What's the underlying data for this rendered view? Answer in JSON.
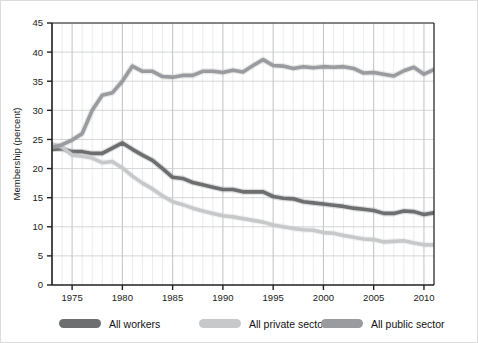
{
  "chart_data": {
    "type": "line",
    "title": "",
    "xlabel": "",
    "ylabel": "Membership (percent)",
    "xlim": [
      1973,
      2011
    ],
    "ylim": [
      0,
      45
    ],
    "ytick_step": 5,
    "grid": "vertical-yearly-and-horizontal-major",
    "legend_position": "bottom",
    "x": [
      1973,
      1974,
      1975,
      1976,
      1977,
      1978,
      1979,
      1980,
      1981,
      1982,
      1983,
      1984,
      1985,
      1986,
      1987,
      1988,
      1989,
      1990,
      1991,
      1992,
      1993,
      1994,
      1995,
      1996,
      1997,
      1998,
      1999,
      2000,
      2001,
      2002,
      2003,
      2004,
      2005,
      2006,
      2007,
      2008,
      2009,
      2010,
      2011
    ],
    "xticks": [
      1975,
      1980,
      1985,
      1990,
      1995,
      2000,
      2005,
      2010
    ],
    "yticks": [
      0,
      5,
      10,
      15,
      20,
      25,
      30,
      35,
      40,
      45
    ],
    "series": [
      {
        "name": "All workers",
        "color": "#6d6e70",
        "values": [
          23.3,
          23.4,
          22.9,
          22.9,
          22.6,
          22.6,
          23.5,
          24.4,
          23.3,
          22.3,
          21.4,
          20.0,
          18.5,
          18.3,
          17.6,
          17.2,
          16.8,
          16.4,
          16.4,
          16.0,
          16.0,
          16.0,
          15.2,
          14.9,
          14.8,
          14.3,
          14.1,
          13.9,
          13.7,
          13.5,
          13.2,
          13.0,
          12.8,
          12.3,
          12.3,
          12.7,
          12.6,
          12.1,
          12.4
        ]
      },
      {
        "name": "All private sector",
        "color": "#c6c8ca",
        "values": [
          24.2,
          23.7,
          22.3,
          22.1,
          21.8,
          21.0,
          21.2,
          20.1,
          18.7,
          17.5,
          16.5,
          15.3,
          14.3,
          13.8,
          13.2,
          12.7,
          12.3,
          11.9,
          11.7,
          11.4,
          11.1,
          10.8,
          10.3,
          10.0,
          9.7,
          9.5,
          9.4,
          9.0,
          8.9,
          8.5,
          8.2,
          7.9,
          7.8,
          7.4,
          7.5,
          7.6,
          7.2,
          6.9,
          6.9
        ]
      },
      {
        "name": "All public sector",
        "color": "#9a9b9e",
        "values": [
          23.6,
          24.1,
          24.9,
          26.0,
          30.0,
          32.6,
          33.0,
          35.0,
          37.6,
          36.7,
          36.7,
          35.8,
          35.7,
          36.0,
          36.0,
          36.7,
          36.7,
          36.5,
          36.9,
          36.6,
          37.7,
          38.7,
          37.7,
          37.6,
          37.2,
          37.5,
          37.3,
          37.5,
          37.4,
          37.5,
          37.2,
          36.4,
          36.5,
          36.2,
          35.9,
          36.8,
          37.4,
          36.2,
          37.0
        ]
      }
    ]
  },
  "axis": {
    "ylabel": "Membership (percent)",
    "ytick_labels": [
      "0",
      "5",
      "10",
      "15",
      "20",
      "25",
      "30",
      "35",
      "40",
      "45"
    ],
    "xtick_labels": [
      "1975",
      "1980",
      "1985",
      "1990",
      "1995",
      "2000",
      "2005",
      "2010"
    ]
  },
  "legend": {
    "items": [
      {
        "label": "All workers",
        "color": "#6d6e70",
        "swatch": "pill-swatch"
      },
      {
        "label": "All private sector",
        "color": "#c6c8ca",
        "swatch": "pill-swatch"
      },
      {
        "label": "All public sector",
        "color": "#9a9b9e",
        "swatch": "pill-swatch"
      }
    ]
  }
}
